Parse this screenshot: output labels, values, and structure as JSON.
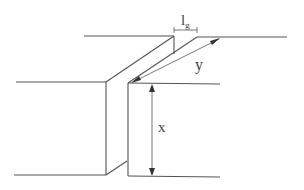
{
  "diagram": {
    "line_color": "#555555",
    "labels": {
      "gap_length": "l",
      "gap_length_sub": "g",
      "depth": "y",
      "height": "x"
    }
  }
}
